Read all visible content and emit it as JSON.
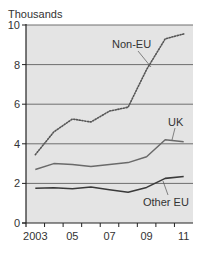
{
  "chart_data": {
    "type": "line",
    "title": "",
    "ylabel": "Thousands",
    "xlabel": "",
    "ylim": [
      0,
      10
    ],
    "yticks": [
      0,
      2,
      4,
      6,
      8,
      10
    ],
    "ytick_labels": [
      "0",
      "2",
      "4",
      "6",
      "8",
      "10"
    ],
    "x": [
      2003,
      2004,
      2005,
      2006,
      2007,
      2008,
      2009,
      2010,
      2011
    ],
    "xtick_labels": [
      "2003",
      "05",
      "07",
      "09",
      "11"
    ],
    "xtick_label_years": [
      2003,
      2005,
      2007,
      2009,
      2011
    ],
    "grid": "horizontal",
    "legend": "inline labels",
    "series": [
      {
        "name": "Non-EU",
        "style": "dotted",
        "values": [
          3.45,
          4.6,
          5.25,
          5.1,
          5.65,
          5.85,
          7.75,
          9.3,
          9.55
        ]
      },
      {
        "name": "UK",
        "style": "solid",
        "values": [
          2.7,
          3.0,
          2.95,
          2.85,
          2.95,
          3.05,
          3.35,
          4.2,
          4.1
        ]
      },
      {
        "name": "Other EU",
        "style": "solid",
        "values": [
          1.75,
          1.78,
          1.73,
          1.82,
          1.68,
          1.55,
          1.8,
          2.25,
          2.35
        ]
      }
    ],
    "annotations": [
      {
        "text": "Non-EU",
        "series": "Non-EU"
      },
      {
        "text": "UK",
        "series": "UK"
      },
      {
        "text": "Other EU",
        "series": "Other EU"
      }
    ]
  },
  "colors": {
    "plot_background": "#e4e4e4",
    "gridline": "#6e6e6e",
    "axis": "#222222",
    "series_non_eu": "#555555",
    "series_uk": "#6a6a6a",
    "series_other_eu": "#3a3a3a",
    "text": "#333333"
  }
}
